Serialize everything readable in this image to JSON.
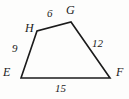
{
  "figure": {
    "kind": "quadrilateral",
    "name": "EFGH",
    "stroke_color": "#1b1b1b",
    "background_color": "#fdfdfc",
    "vertices": [
      {
        "id": "E",
        "label": "E",
        "x": 21,
        "y": 78
      },
      {
        "id": "F",
        "label": "F",
        "x": 110,
        "y": 78
      },
      {
        "id": "G",
        "label": "G",
        "x": 71,
        "y": 22
      },
      {
        "id": "H",
        "label": "H",
        "x": 37,
        "y": 31
      }
    ],
    "sides": [
      {
        "id": "HG",
        "from": "H",
        "to": "G",
        "length_label": "6"
      },
      {
        "id": "GF",
        "from": "G",
        "to": "F",
        "length_label": "12"
      },
      {
        "id": "EF",
        "from": "E",
        "to": "F",
        "length_label": "15"
      },
      {
        "id": "EH",
        "from": "E",
        "to": "H",
        "length_label": "9"
      }
    ]
  }
}
